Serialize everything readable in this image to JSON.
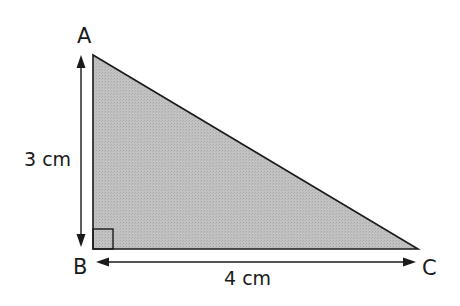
{
  "diagram": {
    "type": "right-triangle",
    "fill_color": "#bdbdbd",
    "stroke_color": "#1a1a1a",
    "vertices": {
      "A": {
        "label": "A"
      },
      "B": {
        "label": "B"
      },
      "C": {
        "label": "C"
      }
    },
    "dimensions": {
      "vertical": {
        "label": "3 cm",
        "side": "AB"
      },
      "horizontal": {
        "label": "4 cm",
        "side": "BC"
      }
    },
    "right_angle_at": "B"
  }
}
